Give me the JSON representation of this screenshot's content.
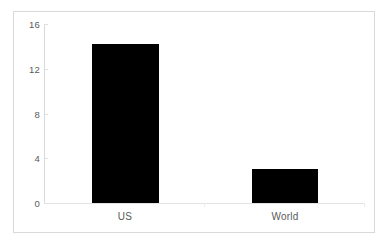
{
  "chart_data": {
    "type": "bar",
    "title": "",
    "subtitle": "",
    "xlabel": "",
    "ylabel": "",
    "categories": [
      "US",
      "World"
    ],
    "values": [
      14.2,
      3.0
    ],
    "series": [
      {
        "name": "",
        "values": [
          14.2,
          3.0
        ]
      }
    ],
    "ylim": [
      0,
      16
    ],
    "ytick_labels": [
      "0",
      "4",
      "8",
      "12",
      "16"
    ],
    "ytick_values": [
      0,
      4,
      8,
      12,
      16
    ],
    "grid": false,
    "legend": false,
    "legend_position": "none",
    "bar_color": "#000000",
    "axis_color": "#d9d9d9",
    "tick_label_color": "#595959",
    "frame_color": "#d9d9d9",
    "background_color": "#ffffff",
    "annotations": []
  },
  "axis": {
    "y_labels": [
      {
        "text": "16",
        "value": 16
      },
      {
        "text": "12",
        "value": 12
      },
      {
        "text": "8",
        "value": 8
      },
      {
        "text": "4",
        "value": 4
      },
      {
        "text": "0",
        "value": 0
      }
    ],
    "x_labels": [
      {
        "text": "US"
      },
      {
        "text": "World"
      }
    ]
  }
}
